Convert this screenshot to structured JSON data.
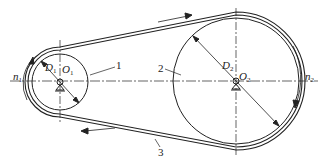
{
  "diagram": {
    "type": "belt-drive",
    "colors": {
      "line": "#222222",
      "background": "#ffffff"
    },
    "small_pulley": {
      "label_number": "1",
      "center_label": "O",
      "center_sub": "1",
      "diameter_label": "D",
      "diameter_sub": "1",
      "speed_label": "n",
      "speed_sub": "1"
    },
    "large_pulley": {
      "label_number": "2",
      "center_label": "O",
      "center_sub": "2",
      "diameter_label": "D",
      "diameter_sub": "2",
      "speed_label": "n",
      "speed_sub": "2"
    },
    "belt": {
      "label_number": "3"
    }
  }
}
